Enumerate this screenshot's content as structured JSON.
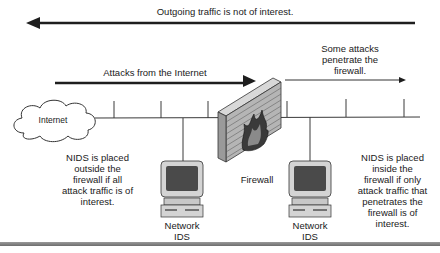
{
  "diagram": {
    "outgoing_label": "Outgoing traffic is not of interest.",
    "attacks_label": "Attacks from the Internet",
    "penetrate_label": "Some attacks penetrate the firewall.",
    "penetrate_lines": [
      "Some attacks",
      "penetrate the",
      "firewall."
    ],
    "internet_label": "Internet",
    "firewall_label": "Firewall",
    "nids_left": {
      "label_lines": [
        "Network",
        "IDS"
      ]
    },
    "nids_right": {
      "label_lines": [
        "Network",
        "IDS"
      ]
    },
    "note_outside_lines": [
      "NIDS is placed",
      "outside the",
      "firewall if all",
      "attack traffic is of",
      "interest."
    ],
    "note_inside_lines": [
      "NIDS is placed",
      "inside the",
      "firewall if only",
      "attack traffic that",
      "penetrates the",
      "firewall is of",
      "interest."
    ],
    "colors": {
      "line": "#3a3a3a",
      "arrow": "#1e1e1e",
      "firewall": "#b5b5b5",
      "monitor": "#cfcfcf",
      "screen": "#4a4a4a"
    }
  }
}
